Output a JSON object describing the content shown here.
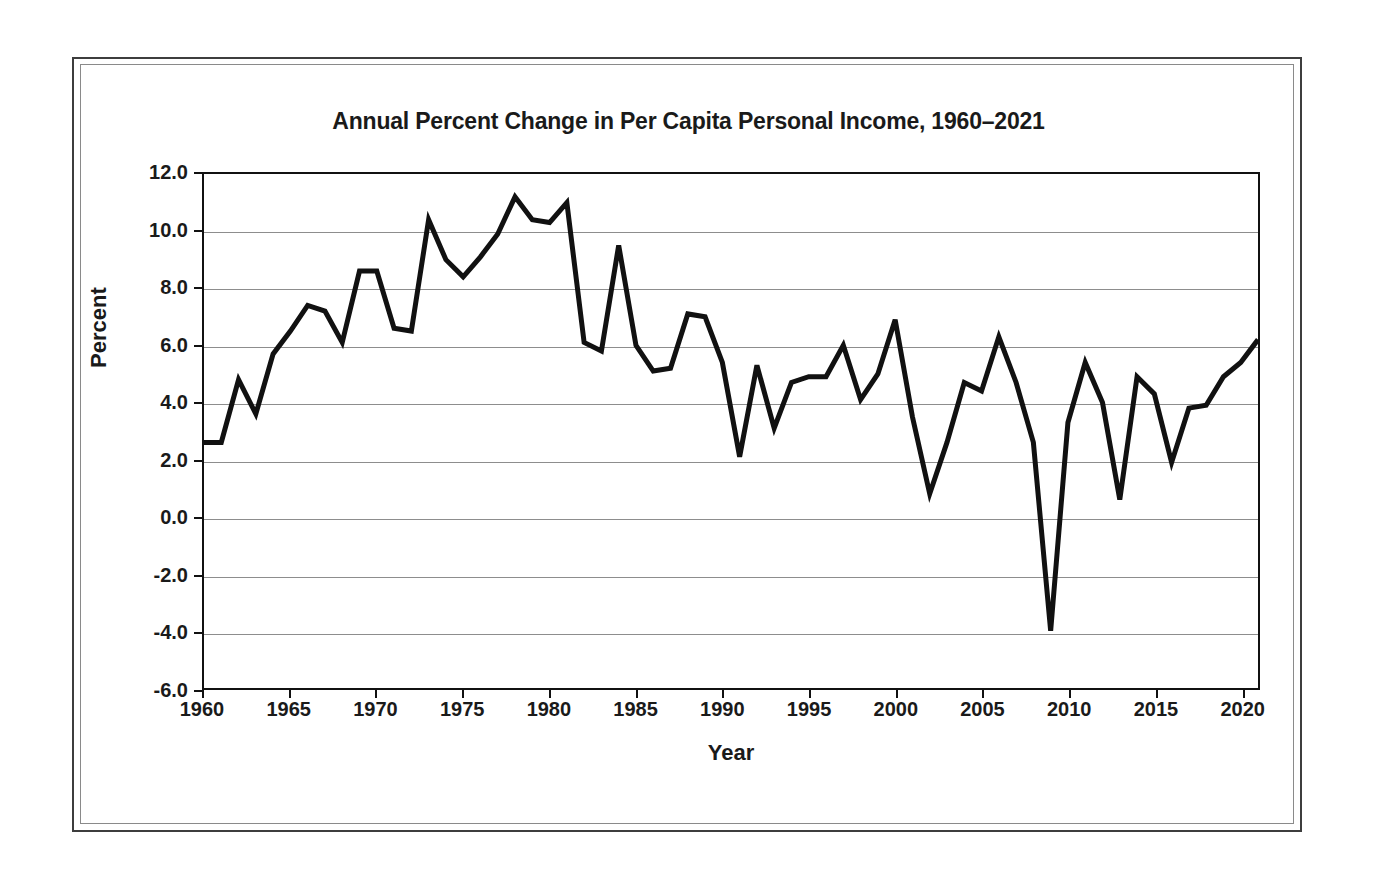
{
  "figure": {
    "title": "Annual Percent Change in Per Capita Personal Income, 1960–2021",
    "x_axis_title": "Year",
    "y_axis_title": "Percent",
    "line_color": "#111111",
    "grid_color": "#8d8d8d",
    "frame_color": "#3d3d3d",
    "background_color": "#ffffff"
  },
  "axes": {
    "y_ticks": [
      "12.0",
      "10.0",
      "8.0",
      "6.0",
      "4.0",
      "2.0",
      "0.0",
      "-2.0",
      "-4.0",
      "-6.0"
    ],
    "x_ticks": [
      "1960",
      "1965",
      "1970",
      "1975",
      "1980",
      "1985",
      "1990",
      "1995",
      "2000",
      "2005",
      "2010",
      "2015",
      "2020"
    ]
  },
  "chart_data": {
    "type": "line",
    "title": "Annual Percent Change in Per Capita Personal Income, 1960–2021",
    "xlabel": "Year",
    "ylabel": "Percent",
    "xlim": [
      1960,
      2021
    ],
    "ylim": [
      -6.0,
      12.0
    ],
    "ytick_step": 2.0,
    "xtick_step": 5,
    "grid": "horizontal",
    "legend": "none",
    "x": [
      1960,
      1961,
      1962,
      1963,
      1964,
      1965,
      1966,
      1967,
      1968,
      1969,
      1970,
      1971,
      1972,
      1973,
      1974,
      1975,
      1976,
      1977,
      1978,
      1979,
      1980,
      1981,
      1982,
      1983,
      1984,
      1985,
      1986,
      1987,
      1988,
      1989,
      1990,
      1991,
      1992,
      1993,
      1994,
      1995,
      1996,
      1997,
      1998,
      1999,
      2000,
      2001,
      2002,
      2003,
      2004,
      2005,
      2006,
      2007,
      2008,
      2009,
      2010,
      2011,
      2012,
      2013,
      2014,
      2015,
      2016,
      2017,
      2018,
      2019,
      2020,
      2021
    ],
    "values": [
      2.6,
      2.6,
      4.8,
      3.6,
      5.7,
      6.5,
      7.4,
      7.2,
      6.1,
      8.6,
      8.6,
      6.6,
      6.5,
      10.4,
      9.0,
      8.4,
      9.1,
      9.9,
      11.2,
      10.4,
      10.3,
      11.0,
      6.1,
      5.8,
      9.5,
      6.0,
      5.1,
      5.2,
      7.1,
      7.0,
      5.4,
      2.1,
      5.3,
      3.1,
      4.7,
      4.9,
      4.9,
      6.0,
      4.1,
      5.0,
      6.9,
      3.5,
      0.8,
      2.6,
      4.7,
      4.4,
      6.3,
      4.7,
      2.6,
      -4.0,
      3.3,
      5.4,
      4.0,
      0.6,
      4.9,
      4.3,
      1.9,
      3.8,
      3.9,
      4.9,
      5.4,
      6.2
    ],
    "series_name": "Annual percent change in per capita personal income",
    "units": "percent"
  }
}
